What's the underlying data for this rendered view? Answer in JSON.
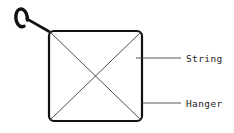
{
  "diagram": {
    "background_color": "#ffffff",
    "stroke_color": "#111111",
    "thin_stroke_color": "#3a3a3a",
    "labels": [
      {
        "id": "string",
        "text": "String",
        "x": 186,
        "y": 59,
        "leader": {
          "x1": 136,
          "y1": 58,
          "x2": 181,
          "y2": 58
        }
      },
      {
        "id": "hanger",
        "text": "Hanger",
        "x": 186,
        "y": 104,
        "leader": {
          "x1": 142,
          "y1": 103,
          "x2": 181,
          "y2": 103
        }
      }
    ],
    "shapes": {
      "frame": {
        "name": "hanger-frame",
        "x": 49,
        "y": 31,
        "width": 93,
        "height": 90,
        "corner_radius": 5,
        "stroke_width": 2.2
      },
      "diagonals": [
        {
          "name": "diagonal-top-left-to-bottom-right",
          "x1": 50,
          "y1": 32,
          "x2": 141,
          "y2": 120
        },
        {
          "name": "diagonal-top-right-to-bottom-left",
          "x1": 141,
          "y1": 32,
          "x2": 50,
          "y2": 120
        }
      ],
      "hook": {
        "name": "hanger-hook",
        "path": "M 27.5 28.5 C 27.8 22.5 26.5 15.5 24.2 11.8 C 22.3 8.8 19.6 8.4 17.8 10.6 C 15.2 13.8 15.4 20.2 17.6 23.8 C 19.0 26.1 21.4 27.0 23.6 26.2",
        "stroke_width": 3.4,
        "neck_path": "M 26.0 19.0 L 49.0 31.5",
        "neck_stroke_width": 2.6
      }
    }
  }
}
